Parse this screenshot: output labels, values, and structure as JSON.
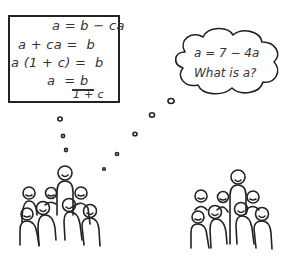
{
  "left_board": {
    "lines": [
      "a = b − ca",
      "a + ca =  b",
      "a (1 + c) =  b",
      "a  =",
      "b",
      "1 + c"
    ]
  },
  "right_bubble": {
    "equation": "a = 7 − 4a",
    "question": "What is a?"
  }
}
